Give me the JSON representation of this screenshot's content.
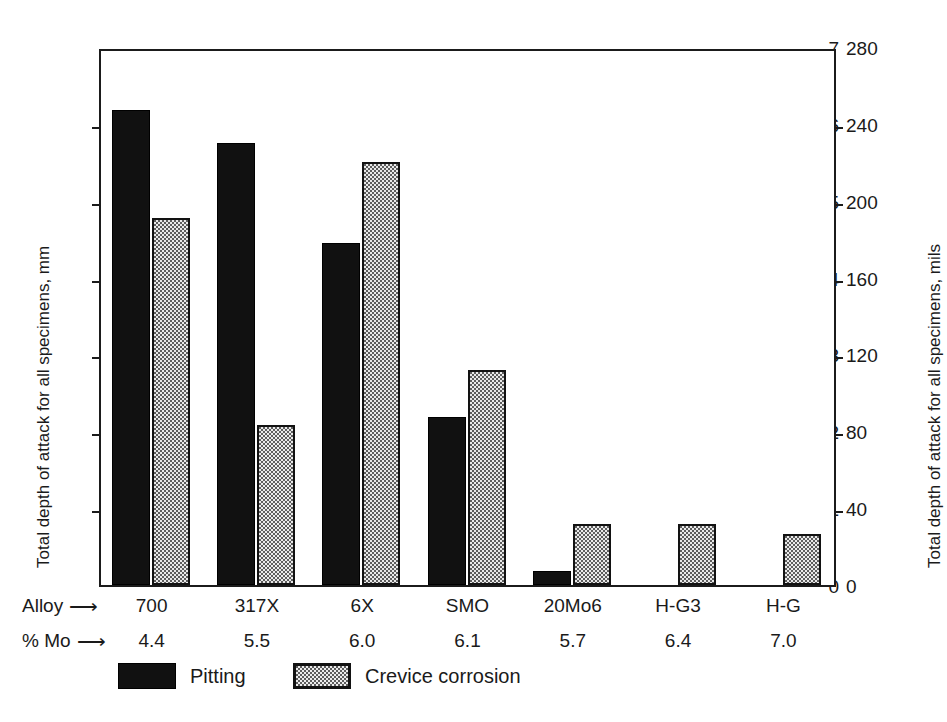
{
  "chart_data": {
    "type": "bar",
    "title": "",
    "subtitle": "",
    "categories": [
      "700",
      "317X",
      "6X",
      "SMO",
      "20Mo6",
      "H-G3",
      "H-G"
    ],
    "series": [
      {
        "name": "Pitting",
        "values": [
          6.18,
          5.75,
          4.45,
          2.18,
          0.18,
          0,
          0
        ]
      },
      {
        "name": "Crevice corrosion",
        "values": [
          4.78,
          2.08,
          5.5,
          2.8,
          0.79,
          0.79,
          0.67
        ]
      }
    ],
    "xlabel": "Alloy",
    "ylabel": "Total depth of attack for all specimens, mm",
    "ylabel_right": "Total depth of attack for all specimens, mils",
    "ylim": [
      0,
      7
    ],
    "ylim_right": [
      0,
      280
    ],
    "yticks": [
      "0",
      "1",
      "2",
      "3",
      "4",
      "5",
      "6",
      "7"
    ],
    "yticks_right": [
      "0",
      "40",
      "80",
      "120",
      "160",
      "200",
      "240",
      "280"
    ],
    "grid": false,
    "legend_position": "bottom-left",
    "secondary_row_label": "% Mo",
    "secondary_row_values": [
      "4.4",
      "5.5",
      "6.0",
      "6.1",
      "5.7",
      "6.4",
      "7.0"
    ]
  },
  "axes": {
    "left_title": "Total depth of attack for all specimens, mm",
    "right_title": "Total depth of attack for all specimens, mils",
    "left_ticks": [
      "7",
      "6",
      "5",
      "4",
      "3",
      "2",
      "1",
      "0"
    ],
    "right_ticks": [
      "280",
      "240",
      "200",
      "160",
      "120",
      "80",
      "40",
      "0"
    ]
  },
  "category_rows": {
    "alloy_label": "Alloy",
    "alloy_arrow": "⟶",
    "mo_label": "% Mo",
    "mo_arrow": "⟶",
    "alloys": [
      "700",
      "317X",
      "6X",
      "SMO",
      "20Mo6",
      "H-G3",
      "H-G"
    ],
    "mo_values": [
      "4.4",
      "5.5",
      "6.0",
      "6.1",
      "5.7",
      "6.4",
      "7.0"
    ]
  },
  "legend": {
    "items": [
      {
        "label": "Pitting",
        "pattern": "solid-black",
        "color": "#111111"
      },
      {
        "label": "Crevice corrosion",
        "pattern": "stipple-dots",
        "color": "#e9e9e9"
      }
    ]
  },
  "colors": {
    "pitting": "#111111",
    "crevice_fill": "#e9e9e9",
    "crevice_dots": "#5d5d5d",
    "axis": "#1b1b1b",
    "text": "#1a1a1a",
    "background": "#ffffff"
  }
}
